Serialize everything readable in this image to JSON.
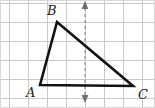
{
  "figure": {
    "kind": "geometry-diagram",
    "canvas": {
      "width": 155,
      "height": 108
    },
    "background_color": "#ffffff",
    "border_color": "#d8d8d8",
    "grid": {
      "visible": true,
      "color": "#c9c9c9",
      "cell_size": 19,
      "origin_x": 9,
      "origin_y": 3,
      "columns": 8,
      "rows": 6
    },
    "triangle": {
      "stroke_color": "#111111",
      "stroke_width": 2.6,
      "fill": "none",
      "vertices": [
        {
          "name": "A",
          "x": 40,
          "y": 85,
          "label": "A",
          "label_x": 26,
          "label_y": 97
        },
        {
          "name": "B",
          "x": 57,
          "y": 22,
          "label": "B",
          "label_x": 47,
          "label_y": 15
        },
        {
          "name": "C",
          "x": 133,
          "y": 86,
          "label": "C",
          "label_x": 138,
          "label_y": 99
        }
      ],
      "sides": [
        {
          "name": "AB",
          "from": "A",
          "to": "B"
        },
        {
          "name": "BC",
          "from": "B",
          "to": "C"
        },
        {
          "name": "AC",
          "from": "A",
          "to": "C"
        }
      ]
    },
    "dashed_axis": {
      "name": "vertical-dashed-double-arrow",
      "x": 85,
      "y_top": 8,
      "y_bottom": 96,
      "color": "#8f8f8f",
      "stroke_width": 1.2,
      "dash_pattern": "3 3",
      "arrow_top": {
        "direction": "up",
        "color": "#6e6e6e"
      },
      "arrow_bottom": {
        "direction": "down",
        "color": "#6e6e6e"
      }
    },
    "labels": {
      "a": "A",
      "b": "B",
      "c": "C"
    }
  }
}
